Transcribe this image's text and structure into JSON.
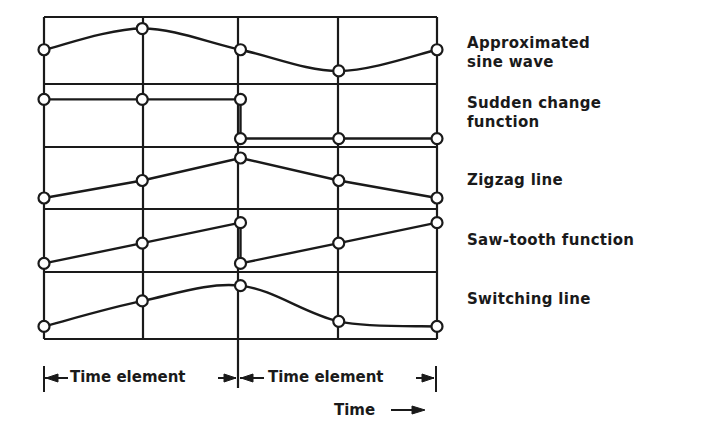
{
  "chart_data": {
    "type": "line",
    "title": "",
    "xlabel": "Time",
    "x": [
      0,
      0.5,
      1,
      1.5,
      2
    ],
    "x_unit": "time element",
    "grid": true,
    "series": [
      {
        "name": "Approximated sine wave",
        "label_lines": [
          "Approximated",
          "sine wave"
        ],
        "curve": "smooth",
        "values": [
          0.3,
          0.9,
          0.3,
          -0.3,
          0.3
        ],
        "y_range": [
          -0.5,
          1.0
        ]
      },
      {
        "name": "Sudden change function",
        "label_lines": [
          "Sudden change",
          "function"
        ],
        "curve": "step",
        "segments": [
          {
            "x": [
              0,
              0.5,
              1
            ],
            "values": [
              0.85,
              0.85,
              0.85
            ]
          },
          {
            "x": [
              1,
              1.5,
              2
            ],
            "values": [
              0.05,
              0.05,
              0.05
            ]
          }
        ],
        "y_range": [
          0,
          1
        ]
      },
      {
        "name": "Zigzag line",
        "label_lines": [
          "Zigzag line"
        ],
        "curve": "linear",
        "values": [
          0.1,
          0.45,
          0.9,
          0.45,
          0.1
        ],
        "y_range": [
          0,
          1
        ]
      },
      {
        "name": "Saw-tooth function",
        "label_lines": [
          "Saw-tooth function"
        ],
        "curve": "linear",
        "segments": [
          {
            "x": [
              0,
              0.5,
              1
            ],
            "values": [
              0.05,
              0.45,
              0.85
            ]
          },
          {
            "x": [
              1,
              1.5,
              2
            ],
            "values": [
              0.05,
              0.45,
              0.85
            ]
          }
        ],
        "y_range": [
          0,
          1
        ]
      },
      {
        "name": "Switching line",
        "label_lines": [
          "Switching line"
        ],
        "curve": "smooth",
        "values": [
          0.05,
          0.55,
          0.85,
          0.15,
          0.05
        ],
        "y_range": [
          0,
          1
        ]
      }
    ],
    "annotations": {
      "interval_labels": [
        "Time element",
        "Time element"
      ],
      "time_label": "Time"
    }
  }
}
